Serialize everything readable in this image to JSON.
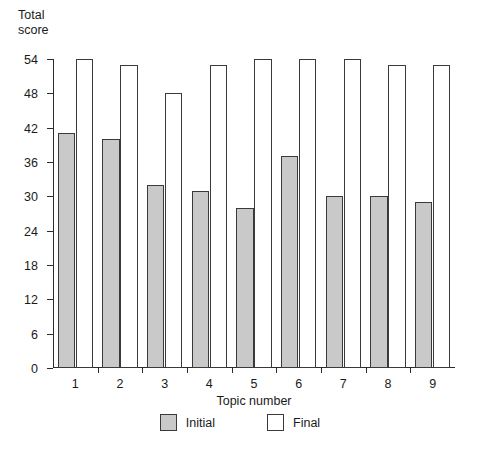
{
  "chart_data": {
    "type": "bar",
    "title": "",
    "xlabel": "Topic number",
    "ylabel": "Total\nscore",
    "categories": [
      "1",
      "2",
      "3",
      "4",
      "5",
      "6",
      "7",
      "8",
      "9"
    ],
    "series": [
      {
        "name": "Initial",
        "color": "#c9c9c9",
        "values": [
          41,
          40,
          32,
          31,
          28,
          37,
          30,
          30,
          29
        ]
      },
      {
        "name": "Final",
        "color": "#ffffff",
        "values": [
          54,
          53,
          48,
          53,
          54,
          54,
          54,
          53,
          53
        ]
      }
    ],
    "ylim": [
      0,
      54
    ],
    "yticks": [
      0,
      6,
      12,
      18,
      24,
      30,
      36,
      42,
      48,
      54
    ],
    "ytick_labels": [
      "0",
      "6",
      "12",
      "18",
      "24",
      "30",
      "36",
      "42",
      "48",
      "54"
    ],
    "grid": false,
    "legend_position": "bottom-center",
    "legend": [
      "Initial",
      "Final"
    ]
  },
  "axes": {
    "y_title_line1": "Total",
    "y_title_line2": "score",
    "x_title": "Topic number"
  },
  "legend": {
    "items": [
      {
        "label": "Initial",
        "fill": "#c9c9c9"
      },
      {
        "label": "Final",
        "fill": "#ffffff"
      }
    ]
  }
}
